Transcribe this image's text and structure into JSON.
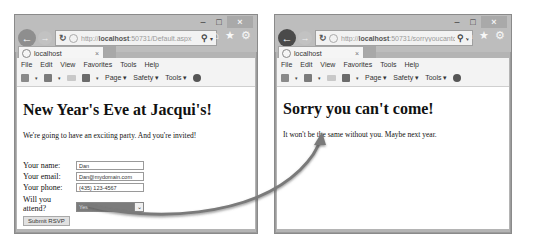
{
  "left_window": {
    "address_url_prefix": "http://",
    "address_url_host": "localhost",
    "address_url_rest": ":50731/Default.aspx",
    "tab_title": "localhost",
    "menu": [
      "File",
      "Edit",
      "View",
      "Favorites",
      "Tools",
      "Help"
    ],
    "cmdbar": {
      "page": "Page",
      "safety": "Safety",
      "tools": "Tools"
    },
    "page": {
      "heading": "New Year's Eve at Jacqui's!",
      "intro": "We're going to have an exciting party. And you're invited!",
      "form": {
        "name_label": "Your name:",
        "name_value": "Dan",
        "email_label": "Your email:",
        "email_value": "Dan@mydomain.com",
        "phone_label": "Your phone:",
        "phone_value": "(435) 123-4567",
        "attend_label_line1": "Will you",
        "attend_label_line2": "attend?",
        "attend_value": "Yes",
        "submit_label": "Submit RSVP"
      }
    }
  },
  "right_window": {
    "address_url_prefix": "http://",
    "address_url_host": "localhost",
    "address_url_rest": ":50731/sorryyoucantcome",
    "tab_title": "localhost",
    "menu": [
      "File",
      "Edit",
      "View",
      "Favorites",
      "Tools",
      "Help"
    ],
    "cmdbar": {
      "page": "Page",
      "safety": "Safety",
      "tools": "Tools"
    },
    "page": {
      "heading": "Sorry you can't come!",
      "message": "It won't be the same without you. Maybe next year."
    }
  },
  "icons": {
    "back": "←",
    "forward": "→",
    "refresh": "↻",
    "search": "⚲",
    "home": "⌂",
    "favorites": "★",
    "settings": "⚙",
    "minimize": "–",
    "maximize": "□",
    "close": "×",
    "tab_close": "×",
    "dropdown": "▾",
    "select_chevron": "⌄"
  }
}
